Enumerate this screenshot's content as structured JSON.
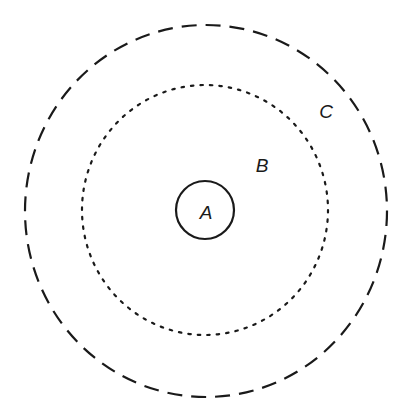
{
  "diagram": {
    "type": "concentric-circles",
    "stroke_color": "#1a1a1a",
    "background": "#ffffff",
    "circles": [
      {
        "id": "A",
        "label": "A",
        "style": "solid",
        "cx": 205,
        "cy": 210,
        "r": 29
      },
      {
        "id": "B",
        "label": "B",
        "style": "dotted",
        "cx": 205,
        "cy": 210,
        "rx": 123,
        "ry": 125
      },
      {
        "id": "C",
        "label": "C",
        "style": "dashed",
        "cx": 206,
        "cy": 211,
        "rx": 181,
        "ry": 186
      }
    ],
    "labels": {
      "a": "A",
      "b": "B",
      "c": "C"
    }
  }
}
